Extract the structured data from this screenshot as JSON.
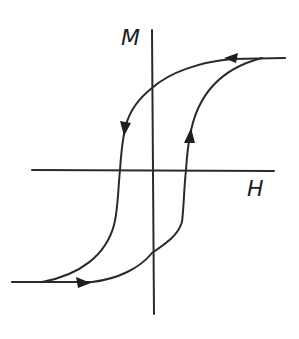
{
  "figure": {
    "labels": {
      "vertical_axis": "M",
      "horizontal_axis": "H"
    },
    "colors": {
      "line": "#2a2a2a",
      "background": "#ffffff"
    },
    "arrows": [
      {
        "location": "top saturation line",
        "direction": "left"
      },
      {
        "location": "descending branch (left)",
        "direction": "down"
      },
      {
        "location": "ascending branch (right)",
        "direction": "up"
      },
      {
        "location": "bottom saturation line",
        "direction": "right"
      }
    ]
  }
}
